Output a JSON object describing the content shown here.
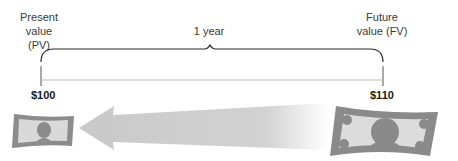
{
  "labels": {
    "present_value_line1": "Present",
    "present_value_line2": "value (PV)",
    "future_value_line1": "Future",
    "future_value_line2": "value (FV)",
    "period": "1 year"
  },
  "values": {
    "present": "$100",
    "future": "$110"
  },
  "icons": {
    "small_bill": "dollar-bill-icon",
    "large_bill": "dollar-bill-icon",
    "arrow": "arrow-left-icon"
  },
  "colors": {
    "bill_dark": "#8a8a8a",
    "bill_light": "#dcdcdc",
    "arrow": "#cfcfcf",
    "line": "#2a2a2a"
  }
}
